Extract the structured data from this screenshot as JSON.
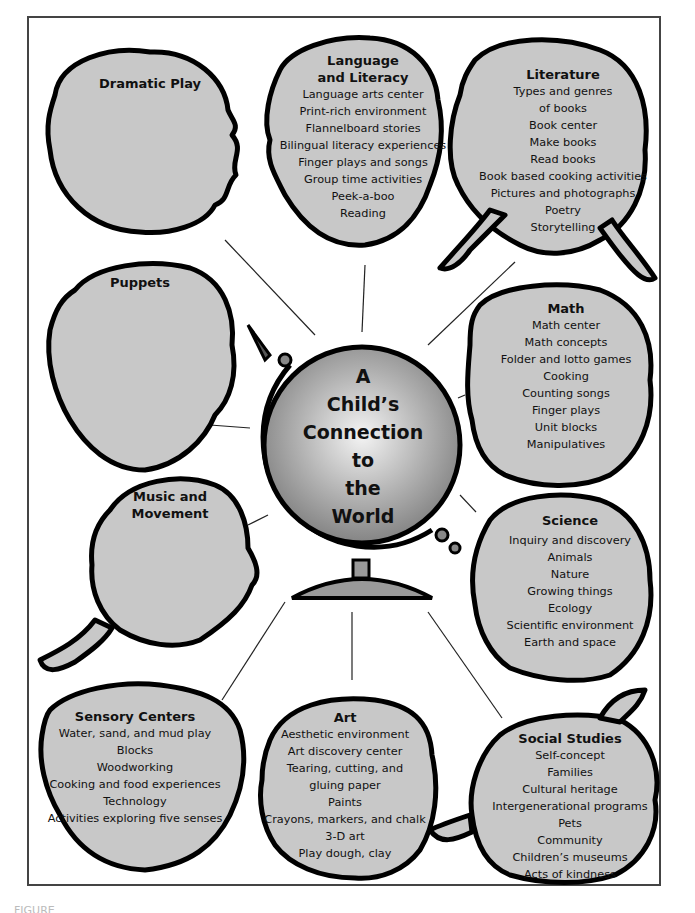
{
  "center": {
    "lines": [
      "A",
      "Child’s",
      "Connection",
      "to",
      "the",
      "World"
    ]
  },
  "colors": {
    "head_fill": "#c8c8c8",
    "outline": "#000000",
    "frame": "#444444",
    "connector": "#222222"
  },
  "nodes": [
    {
      "id": "dramatic-play",
      "title": "Dramatic Play",
      "items": []
    },
    {
      "id": "language-literacy",
      "title": "Language and Literacy",
      "title_lines": [
        "Language",
        "and Literacy"
      ],
      "items": [
        "Language arts center",
        "Print-rich environment",
        "Flannelboard stories",
        "Bilingual literacy experiences",
        "Finger plays and songs",
        "Group time activities",
        "Peek-a-boo",
        "Reading"
      ]
    },
    {
      "id": "literature",
      "title": "Literature",
      "items": [
        "Types and genres",
        "of books",
        "Book center",
        "Make books",
        "Read books",
        "Book based cooking activities",
        "Pictures and photographs",
        "Poetry",
        "Storytelling"
      ]
    },
    {
      "id": "puppets",
      "title": "Puppets",
      "items": []
    },
    {
      "id": "math",
      "title": "Math",
      "items": [
        "Math center",
        "Math concepts",
        "Folder and lotto games",
        "Cooking",
        "Counting songs",
        "Finger plays",
        "Unit blocks",
        "Manipulatives"
      ]
    },
    {
      "id": "music-movement",
      "title": "Music and Movement",
      "title_lines": [
        "Music and",
        "Movement"
      ],
      "items": []
    },
    {
      "id": "science",
      "title": "Science",
      "items": [
        "Inquiry and discovery",
        "Animals",
        "Nature",
        "Growing things",
        "Ecology",
        "Scientific environment",
        "Earth and space"
      ]
    },
    {
      "id": "sensory-centers",
      "title": "Sensory Centers",
      "items": [
        "Water, sand, and mud play",
        "Blocks",
        "Woodworking",
        "Cooking and food experiences",
        "Technology",
        "Activities exploring five senses"
      ]
    },
    {
      "id": "art",
      "title": "Art",
      "items": [
        "Aesthetic environment",
        "Art discovery center",
        "Tearing, cutting, and",
        "gluing paper",
        "Paints",
        "Crayons, markers, and chalk",
        "3-D art",
        "Play dough, clay"
      ]
    },
    {
      "id": "social-studies",
      "title": "Social Studies",
      "items": [
        "Self-concept",
        "Families",
        "Cultural heritage",
        "Intergenerational programs",
        "Pets",
        "Community",
        "Children’s museums",
        "Acts of kindness"
      ]
    }
  ],
  "caption": "FIGURE"
}
